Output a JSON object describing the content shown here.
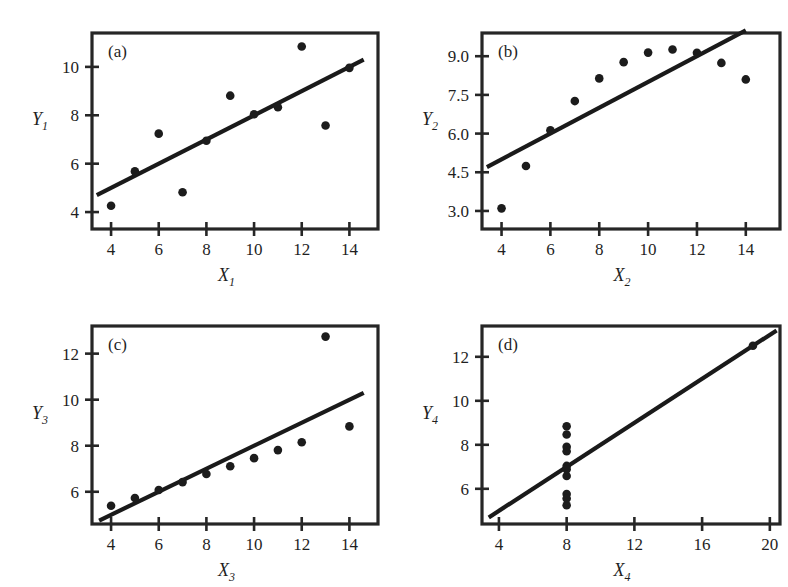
{
  "figure": {
    "background_color": "#ffffff",
    "ink_color": "#1f1f1f",
    "point_color": "#1c1c1c",
    "line_color": "#1a1a1a"
  },
  "chart_data": [
    {
      "type": "scatter",
      "panel_tag": "(a)",
      "title": "",
      "xlabel": "X",
      "xlabel_sub": "1",
      "ylabel": "Y",
      "ylabel_sub": "1",
      "xlim": [
        3.2,
        15.2
      ],
      "ylim": [
        3.3,
        11.4
      ],
      "xticks": [
        4,
        6,
        8,
        10,
        12,
        14
      ],
      "xticklabels": [
        "4",
        "6",
        "8",
        "10",
        "12",
        "14"
      ],
      "yticks": [
        4,
        6,
        8,
        10
      ],
      "yticklabels": [
        "4",
        "6",
        "8",
        "10"
      ],
      "grid": false,
      "legend": "none",
      "x": [
        10.0,
        8.0,
        13.0,
        9.0,
        11.0,
        14.0,
        6.0,
        4.0,
        12.0,
        7.0,
        5.0
      ],
      "y": [
        8.04,
        6.95,
        7.58,
        8.81,
        8.33,
        9.96,
        7.24,
        4.26,
        10.84,
        4.82,
        5.68
      ],
      "fit": {
        "intercept": 3.0,
        "slope": 0.5,
        "x_start": 3.4,
        "x_end": 14.6
      }
    },
    {
      "type": "scatter",
      "panel_tag": "(b)",
      "title": "",
      "xlabel": "X",
      "xlabel_sub": "2",
      "ylabel": "Y",
      "ylabel_sub": "2",
      "xlim": [
        3.2,
        15.4
      ],
      "ylim": [
        2.3,
        9.9
      ],
      "xticks": [
        4,
        6,
        8,
        10,
        12,
        14
      ],
      "xticklabels": [
        "4",
        "6",
        "8",
        "10",
        "12",
        "14"
      ],
      "yticks": [
        3.0,
        4.5,
        6.0,
        7.5,
        9.0
      ],
      "yticklabels": [
        "3.0",
        "4.5",
        "6.0",
        "7.5",
        "9.0"
      ],
      "grid": false,
      "legend": "none",
      "x": [
        10.0,
        8.0,
        13.0,
        9.0,
        11.0,
        14.0,
        6.0,
        4.0,
        12.0,
        7.0,
        5.0
      ],
      "y": [
        9.14,
        8.14,
        8.74,
        8.77,
        9.26,
        8.1,
        6.13,
        3.1,
        9.13,
        7.26,
        4.74
      ],
      "fit": {
        "intercept": 3.0,
        "slope": 0.5,
        "x_start": 3.4,
        "x_end": 14.0
      }
    },
    {
      "type": "scatter",
      "panel_tag": "(c)",
      "title": "",
      "xlabel": "X",
      "xlabel_sub": "3",
      "ylabel": "Y",
      "ylabel_sub": "3",
      "xlim": [
        3.2,
        15.2
      ],
      "ylim": [
        4.6,
        13.2
      ],
      "xticks": [
        4,
        6,
        8,
        10,
        12,
        14
      ],
      "xticklabels": [
        "4",
        "6",
        "8",
        "10",
        "12",
        "14"
      ],
      "yticks": [
        6,
        8,
        10,
        12
      ],
      "yticklabels": [
        "6",
        "8",
        "10",
        "12"
      ],
      "grid": false,
      "legend": "none",
      "x": [
        10.0,
        8.0,
        13.0,
        9.0,
        11.0,
        14.0,
        6.0,
        4.0,
        12.0,
        7.0,
        5.0
      ],
      "y": [
        7.46,
        6.77,
        12.74,
        7.11,
        7.81,
        8.84,
        6.08,
        5.39,
        8.15,
        6.42,
        5.73
      ],
      "fit": {
        "intercept": 3.0,
        "slope": 0.5,
        "x_start": 3.5,
        "x_end": 14.6
      }
    },
    {
      "type": "scatter",
      "panel_tag": "(d)",
      "title": "",
      "xlabel": "X",
      "xlabel_sub": "4",
      "ylabel": "Y",
      "ylabel_sub": "4",
      "xlim": [
        3.0,
        20.6
      ],
      "ylim": [
        4.4,
        13.4
      ],
      "xticks": [
        4,
        8,
        12,
        16,
        20
      ],
      "xticklabels": [
        "4",
        "8",
        "12",
        "16",
        "20"
      ],
      "yticks": [
        6,
        8,
        10,
        12
      ],
      "yticklabels": [
        "6",
        "8",
        "10",
        "12"
      ],
      "grid": false,
      "legend": "none",
      "x": [
        8.0,
        8.0,
        8.0,
        8.0,
        8.0,
        8.0,
        8.0,
        19.0,
        8.0,
        8.0,
        8.0
      ],
      "y": [
        6.58,
        5.76,
        7.71,
        8.84,
        8.47,
        7.04,
        5.25,
        12.5,
        5.56,
        7.91,
        6.89
      ],
      "fit": {
        "intercept": 3.0,
        "slope": 0.5,
        "x_start": 3.4,
        "x_end": 20.4
      }
    }
  ]
}
